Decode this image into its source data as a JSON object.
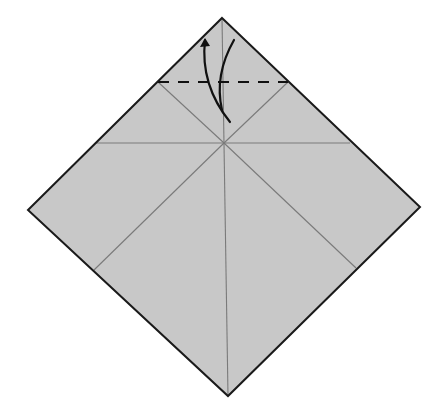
{
  "diagram": {
    "type": "origami-fold-step",
    "colors": {
      "paper_fill": "#c8c8c8",
      "edge": "#1a1a1a",
      "crease": "#7a7a7a",
      "arrow": "#111111",
      "background": "#ffffff"
    },
    "paper": {
      "vertices": {
        "top": [
          222,
          18
        ],
        "right": [
          420,
          207
        ],
        "bottom": [
          228,
          396
        ],
        "left": [
          28,
          210
        ]
      }
    },
    "creases": [
      {
        "name": "vertical-crease",
        "from": [
          222,
          18
        ],
        "to": [
          228,
          396
        ]
      },
      {
        "name": "horizontal-crease",
        "from": [
          95,
          143
        ],
        "to": [
          350,
          143
        ]
      },
      {
        "name": "diagonal-crease-left",
        "from": [
          158,
          82
        ],
        "to": [
          94,
          270
        ],
        "via": [
          224,
          143
        ]
      },
      {
        "name": "diagonal-crease-right",
        "from": [
          288,
          82
        ],
        "to": [
          356,
          268
        ],
        "via": [
          224,
          143
        ]
      }
    ],
    "fold_line": {
      "name": "valley-fold-dashed-line",
      "style": "dashed",
      "from": [
        158,
        82
      ],
      "to": [
        288,
        82
      ]
    },
    "arrows": [
      {
        "name": "fold-down-arrow",
        "path": "M 234 40 Q 214 75 222 110"
      },
      {
        "name": "unfold-up-arrow",
        "path": "M 230 122 Q 200 85 205 40",
        "head": [
          205,
          38
        ]
      }
    ]
  }
}
